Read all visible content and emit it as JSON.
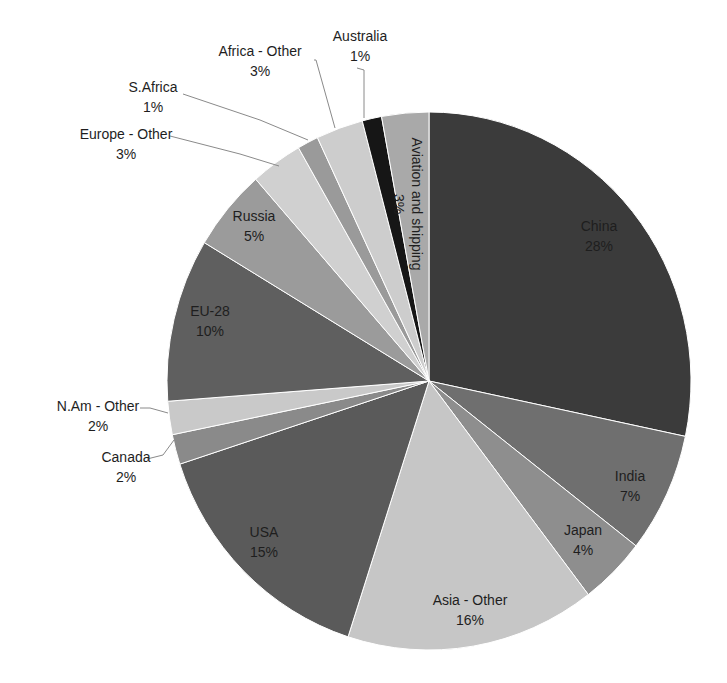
{
  "chart_data": {
    "type": "pie",
    "title": "",
    "start_angle_deg": 0,
    "direction": "clockwise",
    "center": [
      429,
      381
    ],
    "radius": [
      262,
      269
    ],
    "labels_format": "name + percent",
    "categories": [
      "China",
      "India",
      "Japan",
      "Asia - Other",
      "USA",
      "Canada",
      "N.Am - Other",
      "EU-28",
      "Russia",
      "Europe - Other",
      "S.Africa",
      "Africa - Other",
      "Australia",
      "Aviation and shipping"
    ],
    "values": [
      28.3,
      7.2,
      4.1,
      15.4,
      15.0,
      1.8,
      2.0,
      9.8,
      4.9,
      3.2,
      1.3,
      2.9,
      1.2,
      2.9
    ],
    "display_percent": [
      "28%",
      "7%",
      "4%",
      "16%",
      "15%",
      "2%",
      "2%",
      "10%",
      "5%",
      "3%",
      "1%",
      "3%",
      "1%",
      "3%"
    ],
    "colors": [
      "#3b3b3b",
      "#6f6f6f",
      "#8e8e8e",
      "#c6c6c6",
      "#5a5a5a",
      "#8a8a8a",
      "#c9c9c9",
      "#5f5f5f",
      "#9b9b9b",
      "#d0d0d0",
      "#9a9a9a",
      "#cdcdcd",
      "#161616",
      "#a9a9a9"
    ],
    "slices": [
      {
        "name": "China",
        "percent": "28%",
        "label_pos": [
          599,
          231
        ],
        "inside": true
      },
      {
        "name": "India",
        "percent": "7%",
        "label_pos": [
          630,
          481
        ],
        "inside": true
      },
      {
        "name": "Japan",
        "percent": "4%",
        "label_pos": [
          583,
          535
        ],
        "inside": true
      },
      {
        "name": "Asia - Other",
        "percent": "16%",
        "label_pos": [
          470,
          605
        ],
        "inside": true
      },
      {
        "name": "USA",
        "percent": "15%",
        "label_pos": [
          264,
          537
        ],
        "inside": true
      },
      {
        "name": "Canada",
        "percent": "2%",
        "label_pos": [
          126,
          462
        ],
        "inside": false,
        "leader": [
          [
            147,
            459
          ],
          [
            163,
            455
          ],
          [
            174,
            440
          ]
        ]
      },
      {
        "name": "N.Am - Other",
        "percent": "2%",
        "label_pos": [
          98,
          411
        ],
        "inside": false,
        "leader": [
          [
            140,
            408
          ],
          [
            150,
            408
          ],
          [
            168,
            413
          ]
        ]
      },
      {
        "name": "EU-28",
        "percent": "10%",
        "label_pos": [
          210,
          316
        ],
        "inside": true
      },
      {
        "name": "Russia",
        "percent": "5%",
        "label_pos": [
          254,
          221
        ],
        "inside": true
      },
      {
        "name": "Europe - Other",
        "percent": "3%",
        "label_pos": [
          126,
          139
        ],
        "inside": false,
        "leader": [
          [
            170,
            136
          ],
          [
            240,
            154
          ],
          [
            279,
            166
          ]
        ]
      },
      {
        "name": "S.Africa",
        "percent": "1%",
        "label_pos": [
          153,
          92
        ],
        "inside": false,
        "leader": [
          [
            183,
            94
          ],
          [
            260,
            120
          ],
          [
            308,
            140
          ]
        ]
      },
      {
        "name": "Africa - Other",
        "percent": "3%",
        "label_pos": [
          260,
          56
        ],
        "inside": false,
        "leader": [
          [
            314,
            60
          ],
          [
            316,
            60
          ],
          [
            335,
            128
          ]
        ]
      },
      {
        "name": "Australia",
        "percent": "1%",
        "label_pos": [
          360,
          41
        ],
        "inside": false,
        "leader": [
          [
            357,
            68
          ],
          [
            364,
            70
          ],
          [
            364,
            118
          ]
        ]
      },
      {
        "name": "Aviation and shipping",
        "percent": "3%",
        "label_pos": [
          408,
          120
        ],
        "inside": true,
        "rotated": true
      }
    ]
  }
}
